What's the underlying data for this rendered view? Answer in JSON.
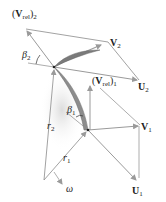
{
  "diagram": {
    "type": "velocity-triangles-radial-impeller",
    "colors": {
      "line": "#8a8a8a",
      "arrow": "#9a9a9a",
      "blade_dark": "#6f6f6f",
      "blade_light": "#b5b5b5",
      "text": "#222222",
      "shadow": "#e6e6e6"
    },
    "labels": {
      "v_rel_2": {
        "base": "V",
        "sub": "rel",
        "outer_sub": "2"
      },
      "v_2": {
        "base": "V",
        "sub": "2"
      },
      "u_2": {
        "base": "U",
        "sub": "2"
      },
      "beta_2": {
        "base": "β",
        "sub": "2"
      },
      "v_rel_1": {
        "base": "V",
        "sub": "rel",
        "outer_sub": "1"
      },
      "beta_1": {
        "base": "β",
        "sub": "1"
      },
      "v_1": {
        "base": "V",
        "sub": "1"
      },
      "u_1": {
        "base": "U",
        "sub": "1"
      },
      "r_2": {
        "base": "r",
        "sub": "2"
      },
      "r_1": {
        "base": "r",
        "sub": "1"
      },
      "omega": "ω"
    },
    "paren_open": "(",
    "paren_close": ")"
  }
}
